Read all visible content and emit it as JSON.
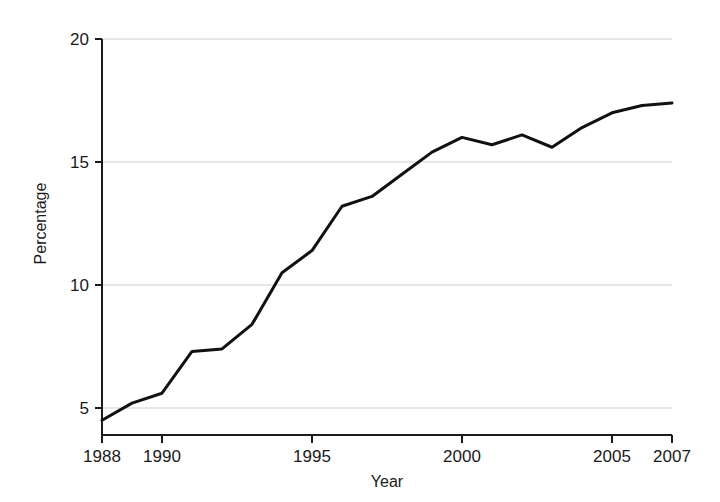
{
  "chart_data": {
    "type": "line",
    "title": "",
    "subtitle": "",
    "xlabel": "Year",
    "ylabel": "Percentage",
    "xlim": [
      1988,
      2007
    ],
    "ylim": [
      4.0,
      20.6
    ],
    "grid": true,
    "grid_axis": "y",
    "legend": false,
    "legend_position": "none",
    "x_ticks": [
      1988,
      1990,
      1995,
      2000,
      2005,
      2007
    ],
    "x_tick_labels": [
      "1988",
      "1990",
      "1995",
      "2000",
      "2005",
      "2007"
    ],
    "y_ticks": [
      5,
      10,
      15,
      20
    ],
    "y_tick_labels": [
      "5",
      "10",
      "15",
      "20"
    ],
    "line_color": "#111111",
    "line_width": 3,
    "x": [
      1988,
      1989,
      1990,
      1991,
      1992,
      1993,
      1994,
      1995,
      1996,
      1997,
      1998,
      1999,
      2000,
      2001,
      2002,
      2003,
      2004,
      2005,
      2006,
      2007
    ],
    "series": [
      {
        "name": "Percentage",
        "values": [
          4.5,
          5.2,
          5.6,
          7.3,
          7.4,
          8.4,
          10.5,
          11.4,
          13.2,
          13.6,
          14.5,
          15.4,
          16.0,
          15.7,
          16.1,
          15.6,
          16.4,
          17.0,
          17.3,
          17.4
        ]
      }
    ]
  },
  "axes": {
    "y_title": "Percentage",
    "x_title": "Year"
  }
}
